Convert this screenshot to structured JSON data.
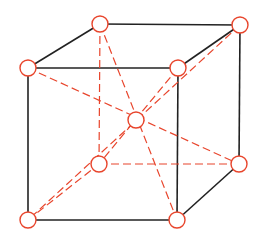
{
  "diagram": {
    "colors": {
      "edge": "#222222",
      "atom": "#e8452c",
      "diagonal": "#e8452c",
      "background": "#ffffff"
    },
    "atom_radius": 8,
    "atoms": [
      {
        "id": "front-top-left",
        "x": 28,
        "y": 68
      },
      {
        "id": "front-top-right",
        "x": 178,
        "y": 68
      },
      {
        "id": "front-bottom-left",
        "x": 28,
        "y": 220
      },
      {
        "id": "front-bottom-right",
        "x": 177,
        "y": 220
      },
      {
        "id": "back-top-left",
        "x": 100,
        "y": 24
      },
      {
        "id": "back-top-right",
        "x": 240,
        "y": 25
      },
      {
        "id": "back-bottom-left",
        "x": 99,
        "y": 164
      },
      {
        "id": "back-bottom-right",
        "x": 239,
        "y": 164
      },
      {
        "id": "body-center",
        "x": 136,
        "y": 120
      }
    ],
    "solid_edges": [
      [
        "front-top-left",
        "front-top-right"
      ],
      [
        "front-top-left",
        "front-bottom-left"
      ],
      [
        "front-top-right",
        "front-bottom-right"
      ],
      [
        "front-bottom-left",
        "front-bottom-right"
      ],
      [
        "back-top-left",
        "back-top-right"
      ],
      [
        "back-top-right",
        "back-bottom-right"
      ],
      [
        "front-top-left",
        "back-top-left"
      ],
      [
        "front-top-right",
        "back-top-right"
      ],
      [
        "front-bottom-right",
        "back-bottom-right"
      ]
    ],
    "dashed_edges": [
      [
        "back-top-left",
        "back-bottom-left"
      ],
      [
        "back-bottom-left",
        "back-bottom-right"
      ],
      [
        "front-bottom-left",
        "back-bottom-left"
      ],
      [
        "front-top-left",
        "back-bottom-right"
      ],
      [
        "back-top-left",
        "front-bottom-right"
      ],
      [
        "back-top-right",
        "front-bottom-left"
      ],
      [
        "front-top-right",
        "back-bottom-left"
      ]
    ]
  }
}
